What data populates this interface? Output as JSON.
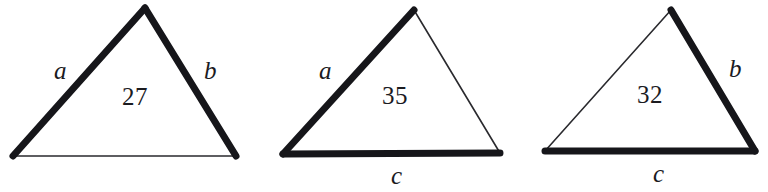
{
  "figure": {
    "background_color": "#ffffff",
    "stroke_color": "#16161a",
    "thin_stroke_color": "#2a2a2e",
    "triangles": [
      {
        "id": "triangle-1",
        "value_label": "27",
        "side_labels": {
          "left": "a",
          "right": "b",
          "base": ""
        },
        "bold_sides": "left-and-right",
        "vertices": {
          "apex": [
            145,
            8
          ],
          "bottom_left": [
            13,
            156
          ],
          "bottom_right": [
            236,
            156
          ]
        }
      },
      {
        "id": "triangle-2",
        "value_label": "35",
        "side_labels": {
          "left": "a",
          "right": "",
          "base": "c"
        },
        "bold_sides": "left-and-base",
        "vertices": {
          "apex": [
            414,
            10
          ],
          "bottom_left": [
            283,
            154
          ],
          "bottom_right": [
            500,
            153
          ]
        }
      },
      {
        "id": "triangle-3",
        "value_label": "32",
        "side_labels": {
          "left": "",
          "right": "b",
          "base": "c"
        },
        "bold_sides": "right-and-base",
        "vertices": {
          "apex": [
            671,
            10
          ],
          "bottom_left": [
            545,
            151
          ],
          "bottom_right": [
            755,
            151
          ]
        }
      }
    ]
  }
}
